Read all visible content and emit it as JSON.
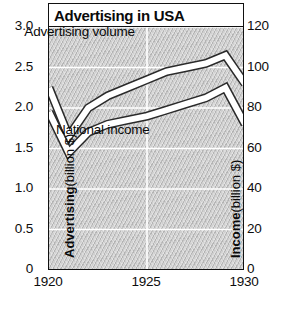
{
  "title": "Advertising in USA",
  "axes": {
    "left_title_strong": "Advertising",
    "left_title_unit": "(billion $)",
    "right_title_strong": "Income",
    "right_title_unit": "(billion $)",
    "left_ticks": [
      "3.0",
      "2.5",
      "2.0",
      "1.5",
      "1.0",
      "0.5",
      "0"
    ],
    "right_ticks": [
      "120",
      "100",
      "80",
      "60",
      "40",
      "20",
      "0"
    ],
    "x_ticks": [
      "1920",
      "1925",
      "1930"
    ]
  },
  "series_labels": {
    "advertising": "Advertising volume",
    "income": "National income"
  },
  "colors": {
    "plot_background": "#c9c9c9",
    "line_fill": "#ffffff",
    "line_stroke": "#2a2a2a",
    "gridline": "#ffffff",
    "frame": "#111111",
    "text": "#0a0a0a"
  },
  "chart_data": {
    "type": "line",
    "title": "Advertising in USA",
    "xlabel": "",
    "ylabel": "Advertising (billion $)",
    "y2label": "Income (billion $)",
    "xlim": [
      1920,
      1930
    ],
    "ylim": [
      0,
      3.0
    ],
    "y2lim": [
      0,
      120
    ],
    "grid": true,
    "legend": "inline-annotations",
    "x": [
      1920,
      1921,
      1922,
      1923,
      1924,
      1925,
      1926,
      1927,
      1928,
      1929,
      1930
    ],
    "series": [
      {
        "name": "Advertising volume",
        "axis": "left",
        "unit": "billion $",
        "values": [
          2.25,
          1.65,
          2.0,
          2.15,
          2.25,
          2.35,
          2.45,
          2.5,
          2.55,
          2.65,
          2.3
        ]
      },
      {
        "name": "National income",
        "axis": "right",
        "unit": "billion $",
        "values": [
          78,
          58,
          68,
          72,
          74,
          76,
          79,
          82,
          85,
          90,
          72
        ]
      }
    ],
    "annotations": [
      {
        "text": "Advertising volume",
        "x": 1921.6,
        "y": 2.92
      },
      {
        "text": "National income",
        "x": 1922.8,
        "y": 1.72
      }
    ]
  }
}
